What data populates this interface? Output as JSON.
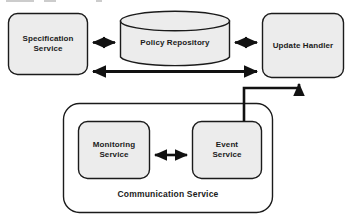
{
  "diagram": {
    "type": "block-architecture-diagram",
    "background_color": "#ffffff",
    "node_fill_color": "#ececec",
    "node_stroke_color": "#1b1b1b",
    "connector_color": "#111111",
    "nodes": [
      {
        "id": "specification-service",
        "label": "Specification\nService",
        "shape": "rounded-rectangle",
        "x": 8,
        "y": 13,
        "width": 80,
        "height": 62
      },
      {
        "id": "policy-repository",
        "label": "Policy Repository",
        "shape": "cylinder",
        "x": 120,
        "y": 11,
        "width": 110,
        "height": 56
      },
      {
        "id": "update-handler",
        "label": "Update Handler",
        "shape": "rounded-rectangle",
        "x": 262,
        "y": 13,
        "width": 82,
        "height": 65
      },
      {
        "id": "monitoring-service",
        "label": "Monitoring\nService",
        "shape": "rounded-rectangle",
        "x": 78,
        "y": 121,
        "width": 72,
        "height": 58
      },
      {
        "id": "event-service",
        "label": "Event\nService",
        "shape": "rounded-rectangle",
        "x": 192,
        "y": 121,
        "width": 70,
        "height": 58
      }
    ],
    "containers": [
      {
        "id": "communication-service",
        "label": "Communication Service",
        "shape": "rounded-rectangle",
        "x": 63,
        "y": 103,
        "width": 210,
        "height": 110,
        "fill": "none",
        "label_position": "bottom-center"
      }
    ],
    "connectors": [
      {
        "id": "spec-to-policy",
        "from": "specification-service",
        "to": "policy-repository",
        "direction": "bidirectional",
        "style": "straight-horizontal"
      },
      {
        "id": "policy-to-update",
        "from": "policy-repository",
        "to": "update-handler",
        "direction": "bidirectional",
        "style": "straight-horizontal"
      },
      {
        "id": "spec-to-update",
        "from": "specification-service",
        "to": "update-handler",
        "direction": "bidirectional",
        "style": "straight-horizontal-long"
      },
      {
        "id": "event-to-update",
        "from": "event-service",
        "to": "update-handler",
        "direction": "unidirectional",
        "style": "orthogonal-elbow"
      },
      {
        "id": "monitoring-to-event",
        "from": "monitoring-service",
        "to": "event-service",
        "direction": "bidirectional",
        "style": "straight-horizontal"
      }
    ]
  }
}
